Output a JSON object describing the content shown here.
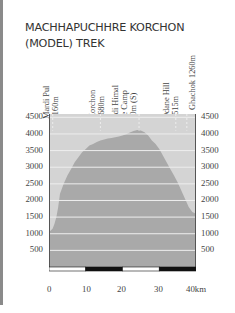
{
  "title": {
    "line1": "MACHHAPUCHHRE KORCHON",
    "line2": "(MODEL) TREK"
  },
  "waypoints": [
    {
      "name": "Mardi Pul",
      "elev": "1160m",
      "km": 1
    },
    {
      "name": "Korchon",
      "elev": "3680m",
      "km": 14
    },
    {
      "name": "Mardi Himal Base Camp",
      "name_line1": "Mardi Himal",
      "name_line2": "Base Camp",
      "elev": "4120m (S)",
      "km": 24.5
    },
    {
      "name": "Odane Hill",
      "elev": "2515m",
      "km": 34.5
    },
    {
      "name": "Ghachok",
      "elev": "1260m",
      "km": 37.5
    }
  ],
  "chart_data": {
    "type": "area",
    "title": "MACHHAPUCHHRE KORCHON (MODEL) TREK",
    "xlabel": "km",
    "ylabel": "Elevation (m)",
    "x_ticks": [
      "0",
      "10",
      "20",
      "30",
      "40km"
    ],
    "y_ticks": [
      500,
      1000,
      1500,
      2000,
      2500,
      3000,
      3500,
      4000,
      4500
    ],
    "xlim": [
      0,
      40
    ],
    "ylim": [
      0,
      4600
    ],
    "grid": true,
    "x": [
      0,
      0.5,
      1,
      1.5,
      2,
      2.5,
      3,
      4,
      5,
      6,
      7,
      8,
      9,
      10,
      11,
      12,
      13,
      14,
      15,
      16,
      17,
      18,
      19,
      20,
      21,
      22,
      23,
      24,
      25,
      26,
      27,
      28,
      29,
      30,
      31,
      32,
      33,
      34,
      35,
      36,
      37,
      38,
      39,
      40
    ],
    "values": [
      1050,
      1100,
      1160,
      1300,
      1500,
      1800,
      2200,
      2500,
      2750,
      2950,
      3150,
      3300,
      3450,
      3550,
      3650,
      3700,
      3760,
      3800,
      3830,
      3860,
      3880,
      3900,
      3920,
      3950,
      3990,
      4040,
      4090,
      4120,
      4100,
      4050,
      3950,
      3800,
      3700,
      3550,
      3350,
      3150,
      2950,
      2750,
      2550,
      2300,
      2050,
      1800,
      1650,
      1600
    ],
    "waypoint_markers_km": [
      1,
      14,
      24.5,
      34.5,
      37.5
    ],
    "scale_bar": [
      {
        "from": 0,
        "to": 10,
        "color": "white"
      },
      {
        "from": 10,
        "to": 20,
        "color": "black"
      },
      {
        "from": 20,
        "to": 30,
        "color": "white"
      },
      {
        "from": 30,
        "to": 40,
        "color": "black"
      }
    ],
    "colors": {
      "background_area": "#d4d4d4",
      "profile_fill": "#a9a9a9",
      "gridline": "#eeeeee",
      "axis": "#555555"
    }
  }
}
